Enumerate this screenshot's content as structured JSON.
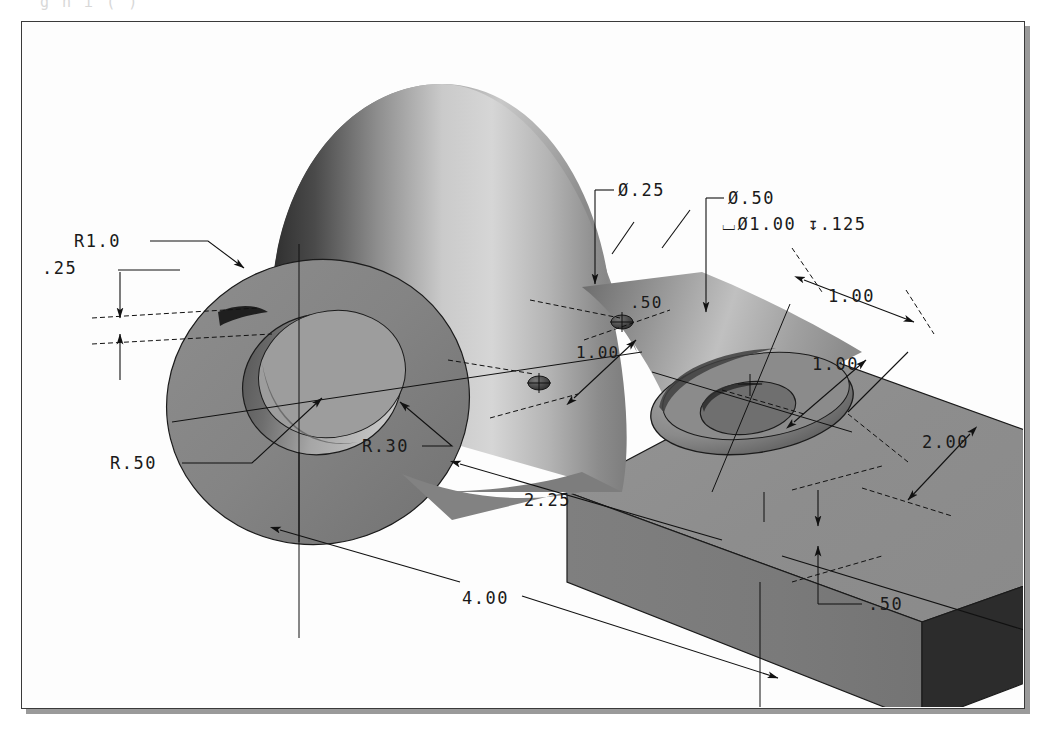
{
  "drawing": {
    "title": "Isometric dimensioned part drawing",
    "clipped_header_text": "g    n  i  (             )",
    "frame": {
      "border_color": "#3a3a3a",
      "shadow_color": "#9a9a9a",
      "background_color": "#fdfdfd"
    },
    "model": {
      "name": "machined-bracket-block",
      "face_colors": {
        "top": "#8e8e8e",
        "front": "#7a7a7a",
        "right_end": "#2e2e2e",
        "boss_light": "#cfcfcf",
        "boss_dark": "#3c3c3c",
        "flange_face": "#8a8a8a",
        "bore_inner": "#6e6e6e"
      }
    },
    "annotations": [
      {
        "id": "r1-0",
        "label": "R1.0",
        "kind": "radius-leader"
      },
      {
        "id": "thickness-25",
        "label": ".25",
        "kind": "linear-dim"
      },
      {
        "id": "r-50",
        "label": "R.50",
        "kind": "radius-leader"
      },
      {
        "id": "r-30",
        "label": "R.30",
        "kind": "radius-leader"
      },
      {
        "id": "dia-25",
        "label": "Ø.25",
        "kind": "diameter-leader"
      },
      {
        "id": "dia-50",
        "label": "Ø.50",
        "kind": "diameter-leader"
      },
      {
        "id": "counterbore",
        "label": "⌴Ø1.00 ↧.125",
        "kind": "counterbore-note"
      },
      {
        "id": "hole-spacing-50",
        "label": ".50",
        "kind": "linear-dim"
      },
      {
        "id": "hole-spacing-100",
        "label": "1.00",
        "kind": "linear-dim"
      },
      {
        "id": "cbore-x-100",
        "label": "1.00",
        "kind": "linear-dim"
      },
      {
        "id": "cbore-y-100",
        "label": "1.00",
        "kind": "linear-dim"
      },
      {
        "id": "width-2-00",
        "label": "2.00",
        "kind": "linear-dim"
      },
      {
        "id": "height-50",
        "label": ".50",
        "kind": "linear-dim"
      },
      {
        "id": "length-2-25",
        "label": "2.25",
        "kind": "linear-dim"
      },
      {
        "id": "length-4-00",
        "label": "4.00",
        "kind": "linear-dim"
      }
    ],
    "labels": {
      "r1_0": "R1.0",
      "thk_25": ".25",
      "r_50": "R.50",
      "r_30": "R.30",
      "dia_25": "Ø.25",
      "dia_50": "Ø.50",
      "cbore_note": "⌴Ø1.00 ↧.125",
      "hole_50": ".50",
      "hole_100": "1.00",
      "cbore_x_100": "1.00",
      "cbore_y_100": "1.00",
      "width_200": "2.00",
      "height_50": ".50",
      "len_225": "2.25",
      "len_400": "4.00"
    }
  }
}
